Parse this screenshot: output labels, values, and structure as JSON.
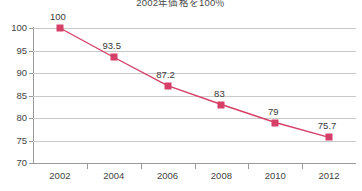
{
  "chart_data": {
    "type": "line",
    "title": "2002年価格を100％",
    "xlabel": "",
    "ylabel": "",
    "categories": [
      "2002",
      "2004",
      "2006",
      "2008",
      "2010",
      "2012"
    ],
    "values": [
      100,
      93.5,
      87.2,
      83,
      79,
      75.7
    ],
    "point_labels": [
      "100",
      "93.5",
      "87.2",
      "83",
      "79",
      "75.7"
    ],
    "series": [
      {
        "name": "価格指数",
        "values": [
          100,
          93.5,
          87.2,
          83,
          79,
          75.7
        ],
        "color": "#d53f68",
        "marker": "square"
      }
    ],
    "ylim": [
      70,
      100
    ],
    "yticks": [
      100,
      95,
      90,
      85,
      80,
      75,
      70
    ],
    "ytick_labels": [
      "100",
      "95",
      "90",
      "85",
      "80",
      "75",
      "70"
    ],
    "grid": "horizontal",
    "legend": "none",
    "colors": {
      "line": "#d53f68",
      "marker": "#d53f68",
      "gridline": "#c9c9c9",
      "axis": "#9a9a9a",
      "text": "#3a3a3a",
      "background": "#ffffff"
    }
  }
}
